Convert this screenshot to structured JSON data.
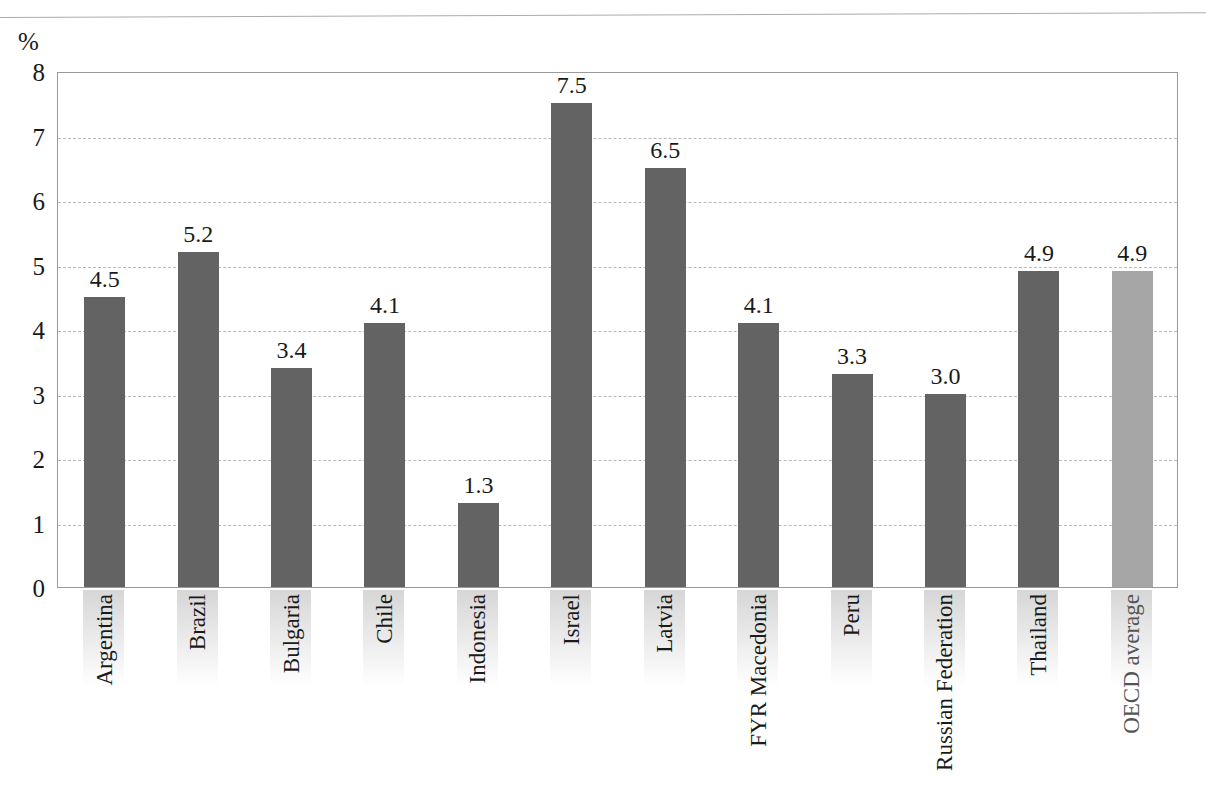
{
  "chart_data": {
    "type": "bar",
    "title": "",
    "subtitle": "",
    "xlabel": "",
    "ylabel": "%",
    "unit_label": "%",
    "ylim": [
      0,
      8
    ],
    "y_ticks": [
      "0",
      "1",
      "2",
      "3",
      "4",
      "5",
      "6",
      "7",
      "8"
    ],
    "grid": true,
    "gridlines_at": [
      1,
      2,
      3,
      4,
      5,
      6,
      7
    ],
    "legend": "none",
    "categories": [
      "Argentina",
      "Brazil",
      "Bulgaria",
      "Chile",
      "Indonesia",
      "Israel",
      "Latvia",
      "FYR Macedonia",
      "Peru",
      "Russian Federation",
      "Thailand",
      "OECD average"
    ],
    "values": [
      4.5,
      5.2,
      3.4,
      4.1,
      1.3,
      7.5,
      6.5,
      4.1,
      3.3,
      3.0,
      4.9,
      4.9
    ],
    "value_labels": [
      "4.5",
      "5.2",
      "3.4",
      "4.1",
      "1.3",
      "7.5",
      "6.5",
      "4.1",
      "3.3",
      "3.0",
      "4.9",
      "4.9"
    ],
    "highlight_index": 11,
    "colors": {
      "bar": "#636363",
      "bar_highlight": "#a6a6a6",
      "gridline": "#b6b9bd",
      "frame": "#9a9a9a",
      "text": "#1a1a1a"
    }
  }
}
